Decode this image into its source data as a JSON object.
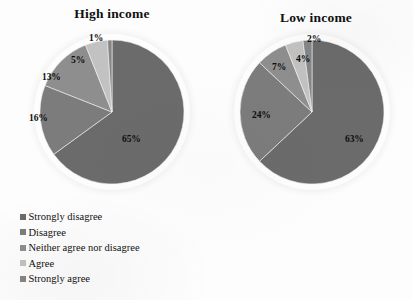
{
  "chart_data": [
    {
      "type": "pie",
      "title": "High income",
      "categories": [
        "Strongly disagree",
        "Disagree",
        "Neither agree nor disagree",
        "Agree",
        "Strongly agree"
      ],
      "values": [
        65,
        16,
        13,
        5,
        1
      ],
      "labels": [
        "65%",
        "16%",
        "13%",
        "5%",
        "1%"
      ],
      "unit": "%",
      "legend_position": "bottom-left",
      "grid": false
    },
    {
      "type": "pie",
      "title": "Low income",
      "categories": [
        "Strongly disagree",
        "Disagree",
        "Neither agree nor disagree",
        "Agree",
        "Strongly agree"
      ],
      "values": [
        63,
        24,
        7,
        4,
        2
      ],
      "labels": [
        "63%",
        "24%",
        "7%",
        "4%",
        "2%"
      ],
      "unit": "%",
      "legend_position": "bottom-left",
      "grid": false
    }
  ],
  "charts": {
    "high_income": {
      "title": "High income",
      "slices": [
        {
          "label": "65%",
          "value": 65,
          "category": "Strongly disagree",
          "color": "#6b6b6b"
        },
        {
          "label": "16%",
          "value": 16,
          "category": "Disagree",
          "color": "#7c7c7c"
        },
        {
          "label": "13%",
          "value": 13,
          "category": "Neither agree nor disagree",
          "color": "#8e8e8e"
        },
        {
          "label": "5%",
          "value": 5,
          "category": "Agree",
          "color": "#c2c2c2"
        },
        {
          "label": "1%",
          "value": 1,
          "category": "Strongly agree",
          "color": "#868686"
        }
      ]
    },
    "low_income": {
      "title": "Low income",
      "slices": [
        {
          "label": "63%",
          "value": 63,
          "category": "Strongly disagree",
          "color": "#6b6b6b"
        },
        {
          "label": "24%",
          "value": 24,
          "category": "Disagree",
          "color": "#7c7c7c"
        },
        {
          "label": "7%",
          "value": 7,
          "category": "Neither agree nor disagree",
          "color": "#8e8e8e"
        },
        {
          "label": "4%",
          "value": 4,
          "category": "Agree",
          "color": "#c2c2c2"
        },
        {
          "label": "2%",
          "value": 2,
          "category": "Strongly agree",
          "color": "#868686"
        }
      ]
    }
  },
  "legend": {
    "items": [
      {
        "label": "Strongly disagree",
        "color": "#6b6b6b"
      },
      {
        "label": "Disagree",
        "color": "#7c7c7c"
      },
      {
        "label": "Neither agree nor disagree",
        "color": "#8e8e8e"
      },
      {
        "label": "Agree",
        "color": "#c2c2c2"
      },
      {
        "label": "Strongly agree",
        "color": "#868686"
      }
    ]
  }
}
